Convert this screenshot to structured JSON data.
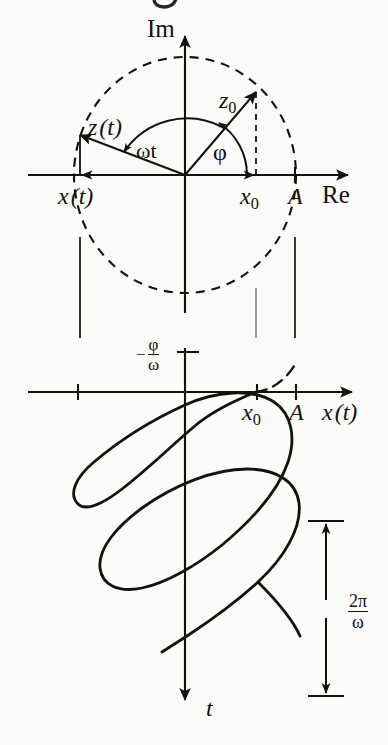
{
  "figure": {
    "title_fragment": "g",
    "ink_color": "#14110f",
    "background_color": "#fbfbf9"
  },
  "phasor_plot": {
    "axes": {
      "imaginary_label": "Im",
      "real_label": "Re"
    },
    "vectors": [
      {
        "name": "z0",
        "base": "z",
        "sub": "0"
      },
      {
        "name": "z(t)",
        "base": "z",
        "arg": "(t)"
      },
      {
        "name": "x(t)",
        "base": "x",
        "arg": "(t)"
      }
    ],
    "angles": [
      {
        "name": "omega-t",
        "label": "ωt"
      },
      {
        "name": "phi",
        "label": "φ"
      }
    ],
    "tick_labels": [
      {
        "name": "x0",
        "base": "x",
        "sub": "0"
      },
      {
        "name": "A",
        "base": "A"
      }
    ],
    "circle_style": "dashed",
    "radius_label": "A"
  },
  "time_plot": {
    "axes": {
      "horizontal_label": {
        "base": "x",
        "arg": "(t)"
      },
      "vertical_label": "t"
    },
    "tick_labels": [
      {
        "name": "x0",
        "base": "x",
        "sub": "0"
      },
      {
        "name": "A",
        "base": "A"
      }
    ],
    "phase_offset": {
      "name": "minus-phi-over-omega",
      "minus": "−",
      "numerator": "φ",
      "denominator": "ω"
    },
    "period": {
      "name": "two-pi-over-omega",
      "numerator": "2π",
      "denominator": "ω"
    },
    "curve_style": "solid",
    "projection_style": "dashed"
  }
}
